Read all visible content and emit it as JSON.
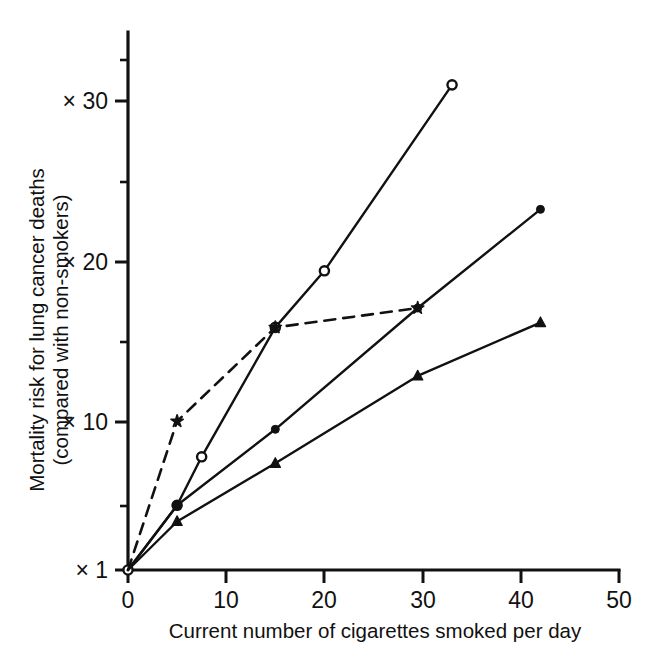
{
  "chart_data": {
    "type": "line",
    "title": "",
    "subtitle": "",
    "xlabel": "Current number of cigarettes smoked per day",
    "ylabel": "Mortality risk for lung cancer deaths (compared with non-smokers)",
    "ylabel_line1": "Mortality risk for lung cancer deaths",
    "ylabel_line2": "(compared with non-smokers)",
    "xlim": [
      0,
      50
    ],
    "ylim": [
      1,
      33
    ],
    "grid": false,
    "legend": "none",
    "xticks": [
      0,
      10,
      20,
      30,
      40,
      50
    ],
    "xtick_labels": [
      "0",
      "10",
      "20",
      "30",
      "40",
      "50"
    ],
    "yticks": [
      1,
      10,
      20,
      30
    ],
    "ytick_labels": [
      "× 1",
      "× 10",
      "× 20",
      "× 30"
    ],
    "yticks_minor": [
      5,
      15,
      25,
      32
    ],
    "series": [
      {
        "name": "series-open-circle",
        "marker": "open-circle",
        "linestyle": "solid",
        "color": "#111111",
        "x": [
          0,
          5,
          7.5,
          15,
          20,
          33
        ],
        "y": [
          1,
          5,
          8,
          16,
          19.5,
          31
        ]
      },
      {
        "name": "series-filled-circle",
        "marker": "filled-circle",
        "linestyle": "solid",
        "color": "#111111",
        "x": [
          0,
          5,
          15,
          29.5,
          42
        ],
        "y": [
          1,
          5,
          9.7,
          17.2,
          23.3
        ]
      },
      {
        "name": "series-filled-triangle",
        "marker": "filled-triangle",
        "linestyle": "solid",
        "color": "#111111",
        "x": [
          0,
          5,
          15,
          29.5,
          42
        ],
        "y": [
          1,
          4,
          7.6,
          13,
          16.3
        ]
      },
      {
        "name": "series-star-dashed",
        "marker": "star",
        "linestyle": "dashed",
        "color": "#111111",
        "x": [
          0,
          5,
          15,
          29.5
        ],
        "y": [
          1,
          10.2,
          16,
          17.2
        ]
      }
    ]
  },
  "axis_labels": {
    "x_title": "Current number of cigarettes smoked per day",
    "y_title_line1": "Mortality risk for lung cancer deaths",
    "y_title_line2": "(compared with non-smokers)"
  },
  "xtick": {
    "t0": "0",
    "t1": "10",
    "t2": "20",
    "t3": "30",
    "t4": "40",
    "t5": "50"
  },
  "ytick": {
    "t1": "× 1",
    "t10": "× 10",
    "t20": "× 20",
    "t30": "× 30"
  },
  "colors": {
    "ink": "#111111",
    "background": "#ffffff"
  }
}
